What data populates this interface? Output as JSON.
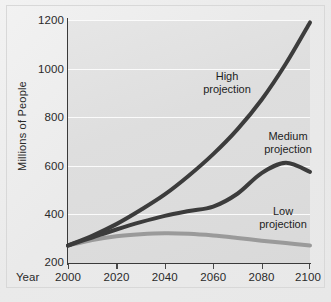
{
  "chart_data": {
    "type": "line",
    "title": "",
    "xlabel": "Year",
    "ylabel": "Millions of People",
    "xlim": [
      2000,
      2100
    ],
    "ylim": [
      200,
      1200
    ],
    "grid": true,
    "legend_position": "inline-annotations",
    "x_ticks": [
      "2000",
      "2020",
      "2040",
      "2060",
      "2080",
      "2100"
    ],
    "x_tick_values": [
      2000,
      2020,
      2040,
      2060,
      2080,
      2100
    ],
    "y_ticks": [
      "200",
      "400",
      "600",
      "800",
      "1000",
      "1200"
    ],
    "y_tick_values": [
      200,
      400,
      600,
      800,
      1000,
      1200
    ],
    "x": [
      2000,
      2010,
      2020,
      2030,
      2040,
      2050,
      2060,
      2070,
      2080,
      2090,
      2100
    ],
    "series": [
      {
        "name": "High projection",
        "color": "#3c3c3c",
        "width": 4,
        "values": [
          272,
          312,
          360,
          418,
          482,
          560,
          648,
          750,
          872,
          1020,
          1190
        ]
      },
      {
        "name": "Medium projection",
        "color": "#3c3c3c",
        "width": 4,
        "values": [
          272,
          305,
          338,
          368,
          394,
          414,
          432,
          485,
          570,
          613,
          575
        ]
      },
      {
        "name": "Low projection",
        "color": "#9a9a9a",
        "width": 4,
        "values": [
          272,
          295,
          310,
          318,
          322,
          320,
          313,
          303,
          292,
          282,
          272
        ]
      }
    ],
    "annotations": [
      {
        "label_line1": "High",
        "label_line2": "projection"
      },
      {
        "label_line1": "Medium",
        "label_line2": "projection"
      },
      {
        "label_line1": "Low",
        "label_line2": "projection"
      }
    ],
    "colors": {
      "plot_background": "#dedede",
      "figure_background": "#eeeeee",
      "gridline": "#fbfbfb",
      "axis": "#3a3a3a",
      "text": "#2a2a2a",
      "dark_series": "#3c3c3c",
      "light_series": "#9a9a9a"
    }
  }
}
